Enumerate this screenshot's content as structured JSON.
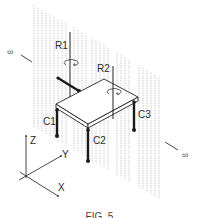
{
  "figure": {
    "type": "patent-style isometric line drawing",
    "caption": "FIG. 5",
    "colors": {
      "line": "#222222",
      "hatch": "#b5b5b5",
      "background": "#ffffff"
    }
  },
  "labels": {
    "r1": "R1",
    "r2": "R2",
    "c1": "C1",
    "c2": "C2",
    "c3": "C3",
    "axis_z": "Z",
    "axis_y": "Y",
    "axis_x": "X",
    "infinity_left": "∞",
    "infinity_right": "∞"
  },
  "elements": {
    "plane": "vertical hatched plane extending to infinity",
    "platform": "rectangular isometric platform on legs",
    "rotation_axes": [
      "R1",
      "R2"
    ],
    "contacts": [
      "C1",
      "C2",
      "C3"
    ],
    "coordinate_axes": [
      "X",
      "Y",
      "Z"
    ]
  }
}
